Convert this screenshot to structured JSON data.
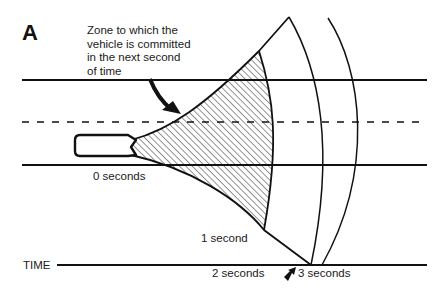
{
  "figure": {
    "panel_letter": "A",
    "annotation": {
      "lines": [
        "Zone to which the",
        "vehicle is committed",
        "in the next second",
        "of time"
      ]
    },
    "time_axis_label": "TIME",
    "time_labels": {
      "t0": "0 seconds",
      "t1": "1 second",
      "t2": "2 seconds",
      "t3": "3 seconds"
    },
    "colors": {
      "ink": "#111111",
      "background": "#ffffff"
    }
  }
}
